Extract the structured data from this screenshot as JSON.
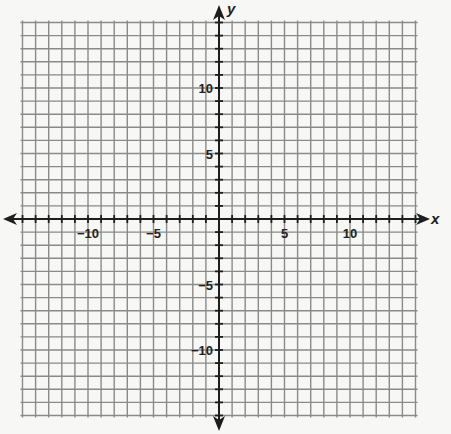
{
  "chart_data": {
    "type": "coordinate-grid",
    "title": "",
    "xlabel": "x",
    "ylabel": "y",
    "xlim": [
      -15,
      15
    ],
    "ylim": [
      -15,
      15
    ],
    "grid": true,
    "grid_step": 1,
    "x_tick_labels": [
      {
        "value": -10,
        "label": "−10"
      },
      {
        "value": -5,
        "label": "−5"
      },
      {
        "value": 5,
        "label": "5"
      },
      {
        "value": 10,
        "label": "10"
      }
    ],
    "y_tick_labels": [
      {
        "value": 10,
        "label": "10"
      },
      {
        "value": 5,
        "label": "5"
      },
      {
        "value": -5,
        "label": "−5"
      },
      {
        "value": -10,
        "label": "−10"
      }
    ],
    "series": []
  },
  "layout": {
    "origin_px": [
      219,
      219
    ],
    "unit_px": 13.1,
    "grid_color": "#8a8a8a",
    "axis_color": "#1e1e1e",
    "background": "#f7f7f5"
  }
}
